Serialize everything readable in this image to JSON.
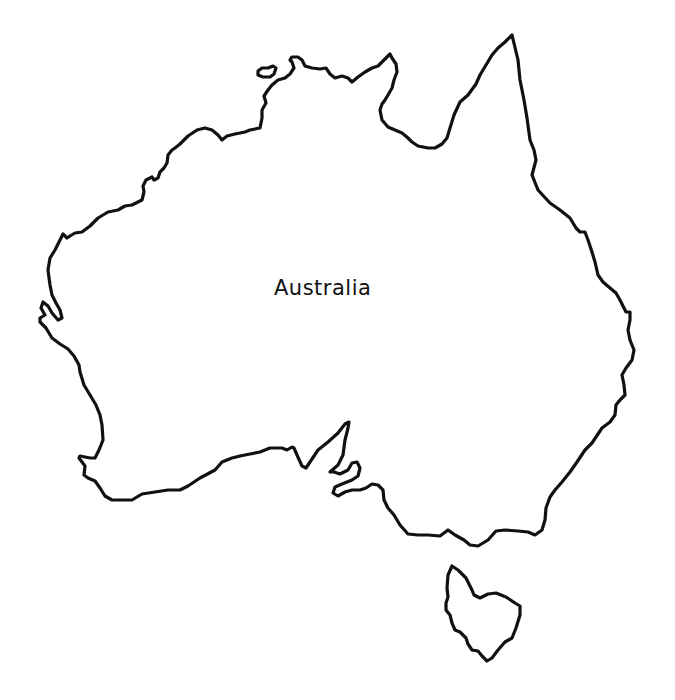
{
  "map": {
    "title": "Australia",
    "style": "outline",
    "stroke_color": "#111111",
    "background_color": "#ffffff",
    "regions": [
      {
        "name": "mainland",
        "label": "Australia"
      },
      {
        "name": "tasmania"
      },
      {
        "name": "melville-island"
      },
      {
        "name": "kangaroo-island"
      }
    ]
  }
}
